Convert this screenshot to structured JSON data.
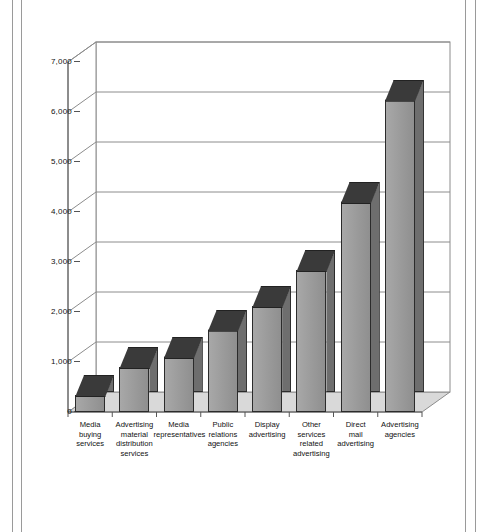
{
  "chart_data": {
    "type": "bar",
    "title": "",
    "subtitle": "",
    "xlabel": "",
    "ylabel": "",
    "ylim": [
      0,
      7000
    ],
    "ytick_labels": [
      "7,000",
      "6,000",
      "5,000",
      "4,000",
      "3,000",
      "2,000",
      "1,000",
      "0"
    ],
    "ytick_values": [
      7000,
      6000,
      5000,
      4000,
      3000,
      2000,
      1000,
      0
    ],
    "grid": true,
    "legend": "none",
    "style": "3d-column",
    "categories": [
      "Media\nbuying\nservices",
      "Advertising\nmaterial\ndistribution\nservices",
      "Media\nrepresentatives",
      "Public\nrelations\nagencies",
      "Display\nadvertising",
      "Other\nservices\nrelated\nadvertising",
      "Direct\nmail\nadvertising",
      "Advertising\nagencies"
    ],
    "values": [
      340,
      900,
      1100,
      1650,
      2120,
      2840,
      4200,
      6250
    ],
    "colors": {
      "bar_face": "#9c9c9c",
      "bar_side": "#6e6e6e",
      "bar_top": "#3a3a3a",
      "floor": "#d9d9d9",
      "wall": "#ffffff",
      "axis": "#555555",
      "gridline": "#8c8c8c",
      "frame_rule": "#9a9a9a"
    }
  }
}
